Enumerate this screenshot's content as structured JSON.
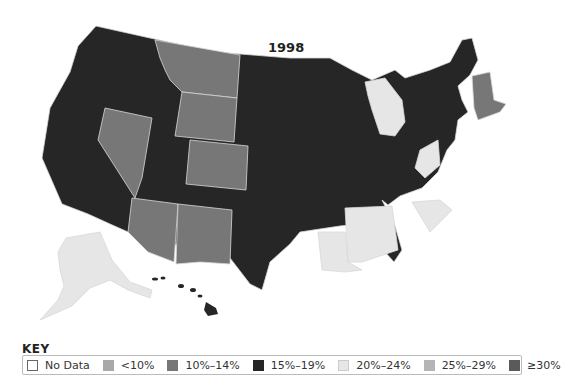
{
  "map": {
    "title": "1998",
    "colors": {
      "no_data": "#ffffff",
      "lt10": "#a9a9a9",
      "10_14": "#777777",
      "15_19": "#262626",
      "20_24": "#e6e6e6",
      "25_29": "#b5b5b5",
      "gte30": "#5a5a5a"
    },
    "state_categories": {
      "15%–19%": [
        "WA",
        "OR",
        "CA",
        "ID",
        "UT",
        "ND",
        "SD",
        "NE",
        "KS",
        "OK",
        "TX",
        "MN",
        "IA",
        "MO",
        "AR",
        "WI",
        "IL",
        "IN",
        "OH",
        "KY",
        "TN",
        "GA",
        "FL",
        "NC",
        "VA",
        "PA",
        "NY",
        "NJ",
        "DE",
        "MD",
        "ME",
        "HI"
      ],
      "10%–14%": [
        "MT",
        "WY",
        "NV",
        "CO",
        "AZ",
        "NM",
        "VT",
        "NH",
        "MA",
        "CT",
        "RI"
      ],
      "20%–24%": [
        "MI",
        "WV",
        "LA",
        "MS",
        "AL",
        "SC",
        "AK"
      ]
    }
  },
  "key": {
    "title": "KEY",
    "items": [
      {
        "label": "No Data",
        "color": "#ffffff"
      },
      {
        "label": "<10%",
        "color": "#a9a9a9"
      },
      {
        "label": "10%–14%",
        "color": "#777777"
      },
      {
        "label": "15%–19%",
        "color": "#262626"
      },
      {
        "label": "20%–24%",
        "color": "#e6e6e6"
      },
      {
        "label": "25%–29%",
        "color": "#b5b5b5"
      },
      {
        "label": "≥30%",
        "color": "#5a5a5a"
      }
    ]
  }
}
